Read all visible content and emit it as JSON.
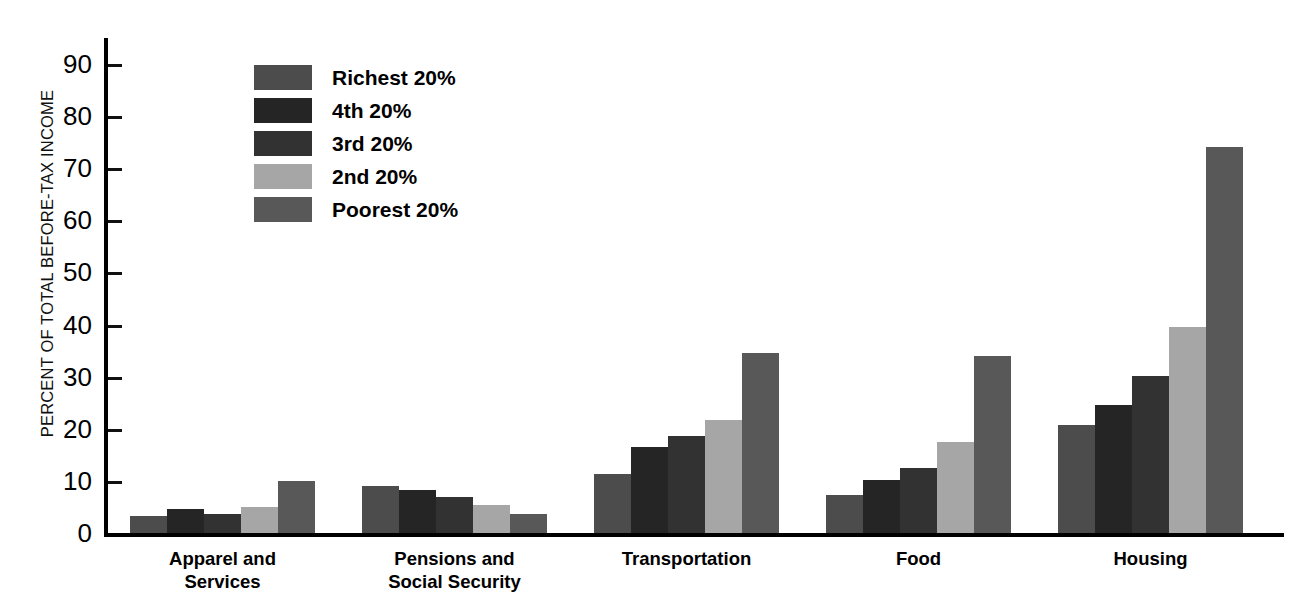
{
  "chart_data": {
    "type": "bar",
    "title": "",
    "xlabel": "",
    "ylabel": "PERCENT OF TOTAL BEFORE-TAX INCOME",
    "ylim": [
      0,
      95
    ],
    "ytick_values": [
      0,
      10,
      20,
      30,
      40,
      50,
      60,
      70,
      80,
      90
    ],
    "ytick_labels": [
      "0",
      "10",
      "20",
      "30",
      "40",
      "50",
      "60",
      "70",
      "80",
      "90"
    ],
    "grid": false,
    "legend_position": "upper-left-inside",
    "categories": [
      "Apparel and\nServices",
      "Pensions and\nSocial Security",
      "Transportation",
      "Food",
      "Housing"
    ],
    "series": [
      {
        "name": "Richest 20%",
        "color": "#4c4c4c",
        "values": [
          3.3,
          9.1,
          11.3,
          7.2,
          20.7
        ]
      },
      {
        "name": "4th 20%",
        "color": "#252525",
        "values": [
          4.6,
          8.3,
          16.6,
          10.1,
          24.5
        ]
      },
      {
        "name": "3rd 20%",
        "color": "#323232",
        "values": [
          3.7,
          6.9,
          18.6,
          12.4,
          30.1
        ]
      },
      {
        "name": "2nd 20%",
        "color": "#a6a6a6",
        "values": [
          4.9,
          5.3,
          21.6,
          17.4,
          39.6
        ]
      },
      {
        "name": "Poorest 20%",
        "color": "#585858",
        "values": [
          9.9,
          3.7,
          34.5,
          34.0,
          74.0
        ]
      }
    ]
  },
  "legend": {
    "items": [
      {
        "label": "Richest 20%"
      },
      {
        "label": "4th 20%"
      },
      {
        "label": "3rd 20%"
      },
      {
        "label": "2nd 20%"
      },
      {
        "label": "Poorest 20%"
      }
    ]
  }
}
